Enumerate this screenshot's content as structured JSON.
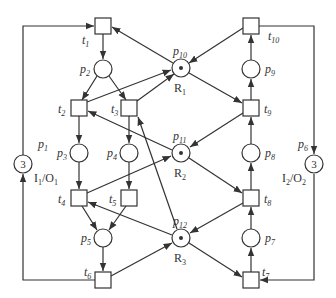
{
  "diagram": {
    "type": "petri-net",
    "colors": {
      "stroke": "#333333",
      "background": "#ffffff"
    },
    "places": [
      {
        "id": "p1",
        "label": "p",
        "sub": "1",
        "tokens": "3",
        "resource": "I",
        "resource_sub": "1",
        "resource_sep": "/O",
        "resource_sub2": "1"
      },
      {
        "id": "p2",
        "label": "p",
        "sub": "2"
      },
      {
        "id": "p3",
        "label": "p",
        "sub": "3"
      },
      {
        "id": "p4",
        "label": "p",
        "sub": "4"
      },
      {
        "id": "p5",
        "label": "p",
        "sub": "5"
      },
      {
        "id": "p6",
        "label": "p",
        "sub": "6",
        "tokens": "3",
        "resource": "I",
        "resource_sub": "2",
        "resource_sep": "/O",
        "resource_sub2": "2"
      },
      {
        "id": "p7",
        "label": "p",
        "sub": "7"
      },
      {
        "id": "p8",
        "label": "p",
        "sub": "8"
      },
      {
        "id": "p9",
        "label": "p",
        "sub": "9"
      },
      {
        "id": "p10",
        "label": "p",
        "sub": "10",
        "token_dot": true,
        "resource": "R",
        "resource_sub": "1"
      },
      {
        "id": "p11",
        "label": "p",
        "sub": "11",
        "token_dot": true,
        "resource": "R",
        "resource_sub": "2"
      },
      {
        "id": "p12",
        "label": "p",
        "sub": "12",
        "token_dot": true,
        "resource": "R",
        "resource_sub": "3"
      }
    ],
    "transitions": [
      {
        "id": "t1",
        "label": "t",
        "sub": "1"
      },
      {
        "id": "t2",
        "label": "t",
        "sub": "2"
      },
      {
        "id": "t3",
        "label": "t",
        "sub": "3"
      },
      {
        "id": "t4",
        "label": "t",
        "sub": "4"
      },
      {
        "id": "t5",
        "label": "t",
        "sub": "5"
      },
      {
        "id": "t6",
        "label": "t",
        "sub": "6"
      },
      {
        "id": "t7",
        "label": "t",
        "sub": "7"
      },
      {
        "id": "t8",
        "label": "t",
        "sub": "8"
      },
      {
        "id": "t9",
        "label": "t",
        "sub": "9"
      },
      {
        "id": "t10",
        "label": "t",
        "sub": "10"
      }
    ],
    "arcs": [
      [
        "p1",
        "t1"
      ],
      [
        "t1",
        "p2"
      ],
      [
        "p2",
        "t2"
      ],
      [
        "p2",
        "t3"
      ],
      [
        "t2",
        "p3"
      ],
      [
        "t3",
        "p4"
      ],
      [
        "p3",
        "t4"
      ],
      [
        "p4",
        "t5"
      ],
      [
        "t4",
        "p5"
      ],
      [
        "t5",
        "p5"
      ],
      [
        "p5",
        "t6"
      ],
      [
        "t6",
        "p1"
      ],
      [
        "p10",
        "t1"
      ],
      [
        "t2",
        "p10"
      ],
      [
        "t3",
        "p10"
      ],
      [
        "t10",
        "p10"
      ],
      [
        "p10",
        "t9"
      ],
      [
        "p11",
        "t2"
      ],
      [
        "t4",
        "p11"
      ],
      [
        "t9",
        "p11"
      ],
      [
        "p11",
        "t8"
      ],
      [
        "p12",
        "t3"
      ],
      [
        "p12",
        "t4"
      ],
      [
        "t6",
        "p12"
      ],
      [
        "t8",
        "p12"
      ],
      [
        "p12",
        "t7"
      ],
      [
        "t7",
        "p7"
      ],
      [
        "p7",
        "t8"
      ],
      [
        "t8",
        "p8"
      ],
      [
        "p8",
        "t9"
      ],
      [
        "t9",
        "p9"
      ],
      [
        "p9",
        "t10"
      ],
      [
        "t10",
        "p6"
      ],
      [
        "p6",
        "t7"
      ]
    ]
  }
}
